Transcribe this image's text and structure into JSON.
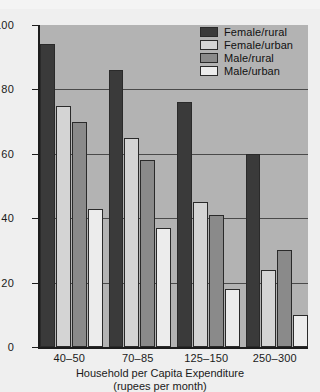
{
  "chart_data": {
    "type": "bar",
    "title": "",
    "xlabel": "Household per Capita Expenditure",
    "xlabel_sub": "(rupees per month)",
    "ylabel": "Percentage of Illiterates Age 15 and Over",
    "categories": [
      "40–50",
      "70–85",
      "125–150",
      "250–300"
    ],
    "series": [
      {
        "name": "Female/rural",
        "color": "#3a3a3a",
        "values": [
          94,
          86,
          76,
          60
        ]
      },
      {
        "name": "Female/urban",
        "color": "#d4d4d4",
        "values": [
          75,
          65,
          45,
          24
        ]
      },
      {
        "name": "Male/rural",
        "color": "#8a8a8a",
        "values": [
          70,
          58,
          41,
          30
        ]
      },
      {
        "name": "Male/urban",
        "color": "#ececec",
        "values": [
          43,
          37,
          18,
          10
        ]
      }
    ],
    "ylim": [
      0,
      100
    ],
    "yticks": [
      0,
      20,
      40,
      60,
      80,
      100
    ],
    "ytick_labels": [
      "0",
      "20",
      "40",
      "60",
      "80",
      "100"
    ],
    "gridlines": [
      20,
      40,
      60,
      80
    ],
    "grid": true,
    "legend_position": "top-right",
    "plot_background": "#b3b3b3",
    "page_background": "#efefef"
  },
  "legend": {
    "items": [
      {
        "label": "Female/rural"
      },
      {
        "label": "Female/urban"
      },
      {
        "label": "Male/rural"
      },
      {
        "label": "Male/urban"
      }
    ]
  }
}
